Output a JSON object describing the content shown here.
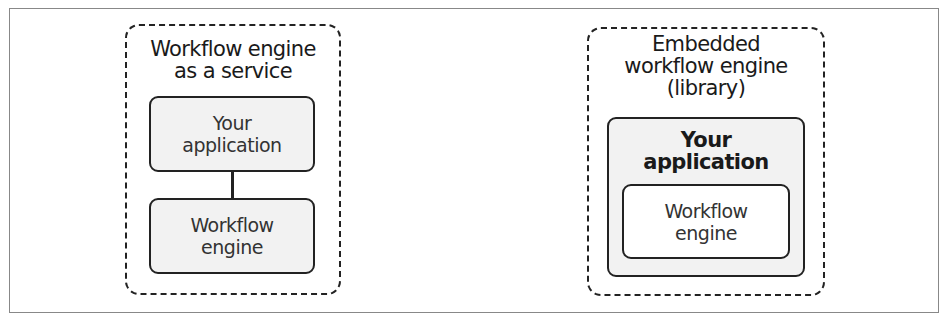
{
  "diagram": {
    "left": {
      "title_line1": "Workflow engine",
      "title_line2": "as a service",
      "app_box": {
        "line1": "Your",
        "line2": "application"
      },
      "engine_box": {
        "line1": "Workflow",
        "line2": "engine"
      }
    },
    "right": {
      "title_line1": "Embedded",
      "title_line2": "workflow engine",
      "title_line3": "(library)",
      "app_box": {
        "line1": "Your",
        "line2": "application"
      },
      "engine_box": {
        "line1": "Workflow",
        "line2": "engine"
      }
    }
  }
}
